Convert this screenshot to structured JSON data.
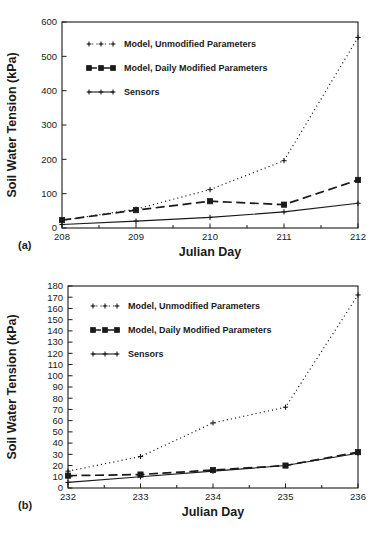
{
  "figure": {
    "panel_a_tag": "(a)",
    "panel_b_tag": "(b)"
  },
  "legend": {
    "entries": [
      {
        "label": "Model, Unmodified Parameters",
        "style": "dotted-plus"
      },
      {
        "label": "Model, Daily Modified Parameters",
        "style": "dashed-square"
      },
      {
        "label": "Sensors",
        "style": "solid-plus"
      }
    ]
  },
  "chart_data": [
    {
      "type": "line",
      "panel": "(a)",
      "title": "",
      "xlabel": "Julian Day",
      "ylabel": "Soil Water Tension (kPa)",
      "x": [
        208,
        209,
        210,
        211,
        212
      ],
      "xlim": [
        208,
        212
      ],
      "ylim": [
        0,
        600
      ],
      "xticks": [
        208,
        209,
        210,
        211,
        212
      ],
      "xtick_labels": [
        "208",
        "209",
        "210",
        "211",
        "212"
      ],
      "yticks": [
        0,
        100,
        200,
        300,
        400,
        500,
        600
      ],
      "ytick_labels": [
        "0",
        "100",
        "200",
        "300",
        "400",
        "500",
        "600"
      ],
      "grid": false,
      "legend_position": "upper-left",
      "series": [
        {
          "name": "Model, Unmodified Parameters",
          "style": "dotted-plus",
          "x": [
            208,
            209,
            210,
            211,
            212
          ],
          "values": [
            22,
            55,
            112,
            196,
            555
          ]
        },
        {
          "name": "Model, Daily Modified Parameters",
          "style": "dashed-square",
          "x": [
            208,
            209,
            210,
            211,
            212
          ],
          "values": [
            23,
            52,
            78,
            68,
            140
          ]
        },
        {
          "name": "Sensors",
          "style": "solid-plus",
          "x": [
            208,
            209,
            210,
            211,
            212
          ],
          "values": [
            10,
            20,
            31,
            47,
            72
          ]
        }
      ]
    },
    {
      "type": "line",
      "panel": "(b)",
      "title": "",
      "xlabel": "Julian Day",
      "ylabel": "Soil Water Tension (kPa)",
      "x": [
        232,
        233,
        234,
        235,
        236
      ],
      "xlim": [
        232,
        236
      ],
      "ylim": [
        0,
        180
      ],
      "xticks": [
        232,
        233,
        234,
        235,
        236
      ],
      "xtick_labels": [
        "232",
        "233",
        "234",
        "235",
        "236"
      ],
      "yticks": [
        0,
        10,
        20,
        30,
        40,
        50,
        60,
        70,
        80,
        90,
        100,
        110,
        120,
        130,
        140,
        150,
        160,
        170,
        180
      ],
      "ytick_labels": [
        "0",
        "10",
        "20",
        "30",
        "40",
        "50",
        "60",
        "70",
        "80",
        "90",
        "100",
        "110",
        "120",
        "130",
        "140",
        "150",
        "160",
        "170",
        "180"
      ],
      "grid": false,
      "legend_position": "upper-left",
      "series": [
        {
          "name": "Model, Unmodified Parameters",
          "style": "dotted-plus",
          "x": [
            232,
            233,
            234,
            235,
            236
          ],
          "values": [
            15,
            28,
            58,
            72,
            172
          ]
        },
        {
          "name": "Model, Daily Modified Parameters",
          "style": "dashed-square",
          "x": [
            232,
            233,
            234,
            235,
            236
          ],
          "values": [
            11,
            12,
            16,
            20,
            32
          ]
        },
        {
          "name": "Sensors",
          "style": "solid-plus",
          "x": [
            232,
            233,
            234,
            235,
            236
          ],
          "values": [
            5,
            10,
            15,
            20,
            31
          ]
        }
      ]
    }
  ],
  "colors": {
    "ink": "#1a1a1a",
    "background": "#ffffff"
  }
}
